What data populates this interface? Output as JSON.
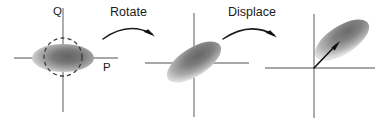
{
  "figure": {
    "name": "phase-space-rotate-displace-diagram",
    "width": 381,
    "height": 123,
    "background_color": "#ffffff"
  },
  "colors": {
    "axis": "#8a8a8a",
    "guide_circle": "#3b3b3b",
    "arrow": "#111111",
    "label_text": "#1a1a1a",
    "blob_dark": "#6e6e6e",
    "blob_mid": "#9a9a9a",
    "blob_light": "#d6d6d6"
  },
  "panels": [
    {
      "id": "panel-1-squeezed",
      "origin": {
        "x": 63,
        "y": 58
      },
      "axes": {
        "horizontal": {
          "x1": 14,
          "y1": 58,
          "x2": 118,
          "y2": 58
        },
        "vertical": {
          "x1": 63,
          "y1": 8,
          "x2": 63,
          "y2": 112
        }
      },
      "axis_labels": [
        {
          "name": "q-axis-label",
          "text": "Q",
          "x": 53,
          "y": 15
        },
        {
          "name": "p-axis-label",
          "text": "P",
          "x": 103,
          "y": 71
        }
      ],
      "blob": {
        "name": "squeezed-state-ellipse",
        "cx": 63,
        "cy": 58,
        "rx": 31,
        "ry": 14,
        "rotation_deg": 0
      },
      "guide_circle": {
        "name": "vacuum-reference-circle",
        "cx": 63,
        "cy": 57,
        "r": 19
      }
    },
    {
      "id": "panel-2-rotated",
      "origin": {
        "x": 194,
        "y": 63
      },
      "axes": {
        "horizontal": {
          "x1": 145,
          "y1": 63,
          "x2": 249,
          "y2": 63
        },
        "vertical": {
          "x1": 194,
          "y1": 13,
          "x2": 194,
          "y2": 117
        }
      },
      "axis_labels": [],
      "blob": {
        "name": "rotated-state-ellipse",
        "cx": 194,
        "cy": 62,
        "rx": 31,
        "ry": 14,
        "rotation_deg": -33
      },
      "guide_circle": null
    },
    {
      "id": "panel-3-displaced",
      "origin": {
        "x": 314,
        "y": 68
      },
      "axes": {
        "horizontal": {
          "x1": 265,
          "y1": 68,
          "x2": 375,
          "y2": 68
        },
        "vertical": {
          "x1": 314,
          "y1": 14,
          "x2": 314,
          "y2": 118
        }
      },
      "axis_labels": [],
      "blob": {
        "name": "displaced-state-ellipse",
        "cx": 342,
        "cy": 40,
        "rx": 31,
        "ry": 14,
        "rotation_deg": -33
      },
      "guide_circle": null,
      "displacement_vector": {
        "name": "displacement-arrow",
        "x1": 314,
        "y1": 68,
        "x2": 339,
        "y2": 42
      }
    }
  ],
  "transitions": [
    {
      "name": "rotate-transition",
      "label": "Rotate",
      "label_x": 110,
      "label_y": 16,
      "arrow_path": "M 103 39 Q 128 21 152 34",
      "arrow_head": {
        "x": 152,
        "y": 34,
        "angle_deg": 30
      }
    },
    {
      "name": "displace-transition",
      "label": "Displace",
      "label_x": 228,
      "label_y": 16,
      "arrow_path": "M 223 39 Q 250 21 274 35",
      "arrow_head": {
        "x": 274,
        "y": 35,
        "angle_deg": 30
      }
    }
  ]
}
